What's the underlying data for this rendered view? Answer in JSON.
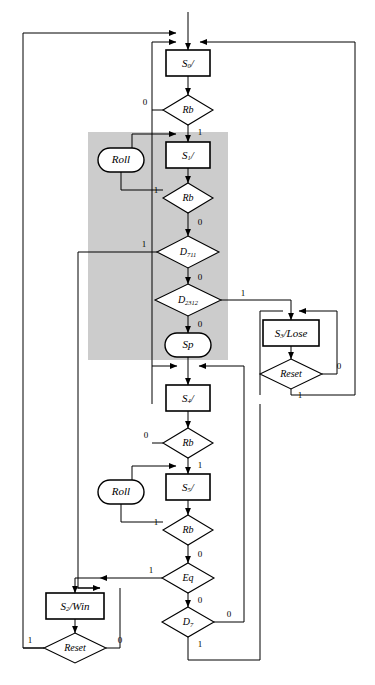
{
  "diagram": {
    "type": "flowchart",
    "shaded_region": {
      "name": "shaded-subchart",
      "color": "#cccccc"
    },
    "nodes": [
      {
        "id": "s0",
        "shape": "rect",
        "label": "S",
        "sub": "0",
        "suffix": "/",
        "name": "state-box-s0",
        "x": 188,
        "y": 63,
        "w": 44,
        "h": 26
      },
      {
        "id": "rb1",
        "shape": "diamond",
        "label": "Rb",
        "name": "decision-rb-1",
        "x": 188,
        "y": 110,
        "w": 50,
        "h": 30
      },
      {
        "id": "roll1",
        "shape": "oval",
        "label": "Roll",
        "name": "output-roll-1",
        "x": 121,
        "y": 160,
        "w": 46,
        "h": 24
      },
      {
        "id": "s1",
        "shape": "rect",
        "label": "S",
        "sub": "1",
        "suffix": "/",
        "name": "state-box-s1",
        "x": 188,
        "y": 155,
        "w": 44,
        "h": 26
      },
      {
        "id": "rb2",
        "shape": "diamond",
        "label": "Rb",
        "name": "decision-rb-2",
        "x": 188,
        "y": 198,
        "w": 50,
        "h": 30
      },
      {
        "id": "d711",
        "shape": "diamond",
        "label": "D",
        "sub": "711",
        "name": "decision-d711",
        "x": 188,
        "y": 252,
        "w": 62,
        "h": 32
      },
      {
        "id": "d2312",
        "shape": "diamond",
        "label": "D",
        "sub": "2312",
        "name": "decision-d2312",
        "x": 188,
        "y": 300,
        "w": 66,
        "h": 32
      },
      {
        "id": "sp",
        "shape": "oval",
        "label": "Sp",
        "name": "output-sp",
        "x": 188,
        "y": 345,
        "w": 46,
        "h": 24
      },
      {
        "id": "s3",
        "shape": "rect",
        "label": "S",
        "sub": "3",
        "suffix": "/Lose",
        "name": "state-box-s3-lose",
        "x": 291,
        "y": 333,
        "w": 56,
        "h": 26
      },
      {
        "id": "reset1",
        "shape": "diamond",
        "label": "Reset",
        "name": "decision-reset-lose",
        "x": 291,
        "y": 374,
        "w": 62,
        "h": 30
      },
      {
        "id": "s4",
        "shape": "rect",
        "label": "S",
        "sub": "4",
        "suffix": "/",
        "name": "state-box-s4",
        "x": 188,
        "y": 398,
        "w": 44,
        "h": 26
      },
      {
        "id": "rb3",
        "shape": "diamond",
        "label": "Rb",
        "name": "decision-rb-3",
        "x": 188,
        "y": 443,
        "w": 50,
        "h": 30
      },
      {
        "id": "roll2",
        "shape": "oval",
        "label": "Roll",
        "name": "output-roll-2",
        "x": 121,
        "y": 492,
        "w": 46,
        "h": 24
      },
      {
        "id": "s5",
        "shape": "rect",
        "label": "S",
        "sub": "5",
        "suffix": "/",
        "name": "state-box-s5",
        "x": 188,
        "y": 487,
        "w": 44,
        "h": 26
      },
      {
        "id": "rb4",
        "shape": "diamond",
        "label": "Rb",
        "name": "decision-rb-4",
        "x": 188,
        "y": 530,
        "w": 50,
        "h": 30
      },
      {
        "id": "eq",
        "shape": "diamond",
        "label": "Eq",
        "name": "decision-eq",
        "x": 188,
        "y": 578,
        "w": 52,
        "h": 30
      },
      {
        "id": "d7",
        "shape": "diamond",
        "label": "D",
        "sub": "7",
        "name": "decision-d7",
        "x": 188,
        "y": 622,
        "w": 52,
        "h": 30
      },
      {
        "id": "s2",
        "shape": "rect",
        "label": "S",
        "sub": "2",
        "suffix": "/Win",
        "name": "state-box-s2-win",
        "x": 75,
        "y": 606,
        "w": 58,
        "h": 26
      },
      {
        "id": "reset2",
        "shape": "diamond",
        "label": "Reset",
        "name": "decision-reset-win",
        "x": 75,
        "y": 648,
        "w": 62,
        "h": 30
      }
    ],
    "edge_labels": [
      {
        "text": "0",
        "name": "edge-label-rb1-0",
        "x": 145,
        "y": 103
      },
      {
        "text": "1",
        "name": "edge-label-rb1-1",
        "x": 200,
        "y": 133
      },
      {
        "text": "1",
        "name": "edge-label-rb2-1",
        "x": 156,
        "y": 191
      },
      {
        "text": "0",
        "name": "edge-label-rb2-0",
        "x": 200,
        "y": 223
      },
      {
        "text": "1",
        "name": "edge-label-d711-1",
        "x": 144,
        "y": 245
      },
      {
        "text": "0",
        "name": "edge-label-d711-0",
        "x": 200,
        "y": 278
      },
      {
        "text": "1",
        "name": "edge-label-d2312-1",
        "x": 243,
        "y": 294
      },
      {
        "text": "0",
        "name": "edge-label-d2312-0",
        "x": 200,
        "y": 325
      },
      {
        "text": "0",
        "name": "edge-label-reset1-0",
        "x": 339,
        "y": 367
      },
      {
        "text": "1",
        "name": "edge-label-reset1-1",
        "x": 300,
        "y": 396
      },
      {
        "text": "0",
        "name": "edge-label-rb3-0",
        "x": 146,
        "y": 436
      },
      {
        "text": "1",
        "name": "edge-label-rb3-1",
        "x": 200,
        "y": 466
      },
      {
        "text": "1",
        "name": "edge-label-rb4-1",
        "x": 156,
        "y": 523
      },
      {
        "text": "0",
        "name": "edge-label-rb4-0",
        "x": 200,
        "y": 555
      },
      {
        "text": "1",
        "name": "edge-label-eq-1",
        "x": 151,
        "y": 571
      },
      {
        "text": "0",
        "name": "edge-label-eq-0",
        "x": 200,
        "y": 601
      },
      {
        "text": "0",
        "name": "edge-label-d7-0",
        "x": 229,
        "y": 615
      },
      {
        "text": "1",
        "name": "edge-label-d7-1",
        "x": 200,
        "y": 645
      },
      {
        "text": "1",
        "name": "edge-label-reset2-1",
        "x": 30,
        "y": 641
      },
      {
        "text": "0",
        "name": "edge-label-reset2-0",
        "x": 120,
        "y": 641
      }
    ]
  }
}
